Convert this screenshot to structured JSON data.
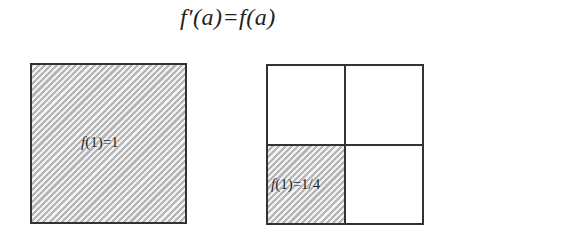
{
  "formula": "f′(a)=f(a)",
  "left_square": {
    "label_fn": "f",
    "label_rest": "(1)=1",
    "shaded": "full"
  },
  "right_square": {
    "grid": "2x2",
    "shaded_cell": "bottom-left",
    "label_fn": "f",
    "label_rest": "(1)=1/4"
  },
  "colors": {
    "stroke": "#333333",
    "hatch_light": "#f2f2f2",
    "hatch_dark": "#b5b5b5"
  }
}
